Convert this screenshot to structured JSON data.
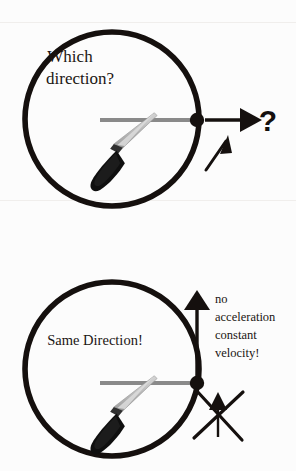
{
  "figure": {
    "title_alt": "Which direction? / Same Direction!",
    "background_color": "#fcfcfc",
    "ink_color": "#15100e",
    "blade_color": "#c8c8c8",
    "blade_shadow_color": "#9a9a9a",
    "handle_color": "#111111",
    "radius_line_color": "#8a8a8a"
  },
  "panels": [
    {
      "id": "top-panel",
      "question_label": {
        "line1": "Which",
        "line2": "direction?"
      },
      "symbols": {
        "question_mark": "?",
        "horizontal_arrow": "right-arrow",
        "diagonal_arrow": "up-right-arrow"
      },
      "circle": {
        "cx": 112,
        "cy": 119,
        "r": 87
      },
      "pivot_dot": {
        "cx": 197,
        "cy": 120,
        "r": 7
      }
    },
    {
      "id": "bottom-panel",
      "answer_label": "Same Direction!",
      "note_lines": [
        "no",
        "acceleration",
        "constant",
        "velocity!"
      ],
      "symbols": {
        "vertical_arrow": "up-arrow",
        "crossed_out_arrow": "crossed-out-up-arrow"
      },
      "circle": {
        "cx": 112,
        "cy": 369,
        "r": 87
      },
      "pivot_dot": {
        "cx": 197,
        "cy": 383,
        "r": 7
      }
    }
  ],
  "artifacts": {
    "top_bleed_text": "",
    "bottom_bleed_text": ""
  }
}
